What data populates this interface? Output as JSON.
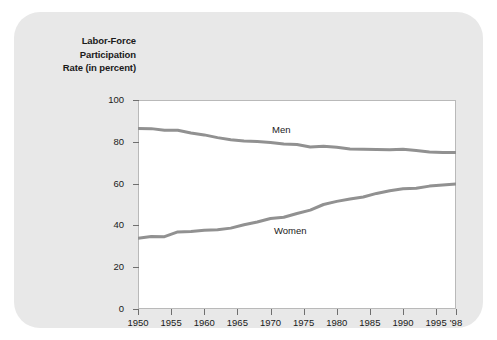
{
  "chart_data": {
    "type": "line",
    "title": "Labor-Force Participation Rate (in percent)",
    "title_lines": [
      "Labor-Force",
      "Participation",
      "Rate (in percent)"
    ],
    "xlabel": "",
    "ylabel": "Labor-Force Participation Rate (in percent)",
    "ylim": [
      0,
      100
    ],
    "xlim": [
      1950,
      1998
    ],
    "grid": false,
    "legend_position": "inline-labels",
    "y_ticks": [
      0,
      20,
      40,
      60,
      80,
      100
    ],
    "y_tick_labels": [
      "0",
      "20",
      "40",
      "60",
      "80",
      "100"
    ],
    "x_ticks": [
      1950,
      1955,
      1960,
      1965,
      1970,
      1975,
      1980,
      1985,
      1990,
      1995,
      1998
    ],
    "x_tick_labels": [
      "1950",
      "1955",
      "1960",
      "1965",
      "1970",
      "1975",
      "1980",
      "1985",
      "1990",
      "1995",
      "'98"
    ],
    "line_color": "#919191",
    "series": [
      {
        "name": "Men",
        "color": "#919191",
        "x": [
          1950,
          1952,
          1954,
          1956,
          1958,
          1960,
          1962,
          1964,
          1966,
          1968,
          1970,
          1972,
          1974,
          1976,
          1978,
          1980,
          1982,
          1984,
          1986,
          1988,
          1990,
          1992,
          1994,
          1996,
          1998
        ],
        "values": [
          86.4,
          86.3,
          85.5,
          85.5,
          84.2,
          83.3,
          82.0,
          81.0,
          80.4,
          80.1,
          79.7,
          78.9,
          78.7,
          77.5,
          77.9,
          77.4,
          76.6,
          76.4,
          76.3,
          76.2,
          76.4,
          75.8,
          75.1,
          74.9,
          74.9
        ]
      },
      {
        "name": "Women",
        "color": "#919191",
        "x": [
          1950,
          1952,
          1954,
          1956,
          1958,
          1960,
          1962,
          1964,
          1966,
          1968,
          1970,
          1972,
          1974,
          1976,
          1978,
          1980,
          1982,
          1984,
          1986,
          1988,
          1990,
          1992,
          1994,
          1996,
          1998
        ],
        "values": [
          33.9,
          34.7,
          34.6,
          36.9,
          37.1,
          37.7,
          37.9,
          38.7,
          40.3,
          41.6,
          43.3,
          43.9,
          45.7,
          47.3,
          50.0,
          51.5,
          52.6,
          53.6,
          55.3,
          56.6,
          57.5,
          57.8,
          58.8,
          59.3,
          59.8
        ]
      }
    ]
  }
}
